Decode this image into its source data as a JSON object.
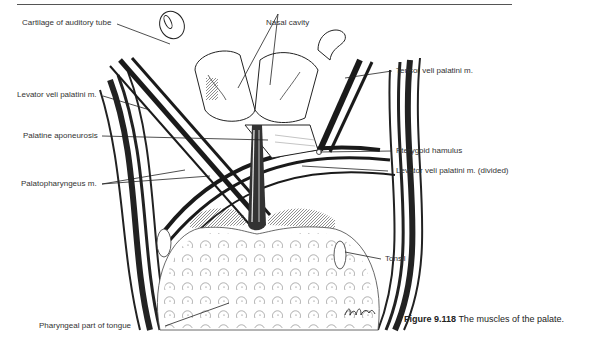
{
  "figure": {
    "number": "Figure 9.118",
    "caption": "The muscles of the palate.",
    "artist_signature": "D. Atelofi"
  },
  "labels": {
    "cartilage_auditory_tube": "Cartilage of auditory tube",
    "nasal_cavity": "Nasal cavity",
    "levator_veli_palatini": "Levator veli palatini m.",
    "tensor_veli_palatini": "Tensor veli palatini m.",
    "palatine_aponeurosis": "Palatine aponeurosis",
    "pterygoid_hamulus": "Pterygoid hamulus",
    "palatopharyngeus": "Palatopharyngeus m.",
    "levator_veli_palatini_divided": "Levator veli palatini m. (divided)",
    "tonsil": "Tonsil",
    "pharyngeal_part_tongue": "Pharyngeal part of tongue"
  }
}
